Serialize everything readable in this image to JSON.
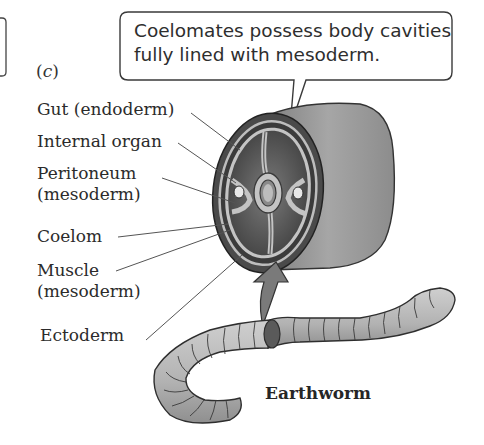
{
  "figure": {
    "panel_letter": "c",
    "callout": {
      "line1": "Coelomates possess body cavities",
      "line2": "fully lined with mesoderm."
    },
    "labels": [
      {
        "line1": "Gut (endoderm)",
        "line2": ""
      },
      {
        "line1": "Internal organ",
        "line2": ""
      },
      {
        "line1": "Peritoneum",
        "line2": "(mesoderm)"
      },
      {
        "line1": "Coelom",
        "line2": ""
      },
      {
        "line1": "Muscle",
        "line2": "(mesoderm)"
      },
      {
        "line1": "Ectoderm",
        "line2": ""
      }
    ],
    "organism_label": "Earthworm",
    "colors": {
      "outer_band": "#4a4a4a",
      "inner_lining": "#bdbdbd",
      "cavity": "#5a5a5a",
      "body_side": "#9a9a9a",
      "worm": "#b8b8b8",
      "leader_lines": "#555555"
    }
  }
}
